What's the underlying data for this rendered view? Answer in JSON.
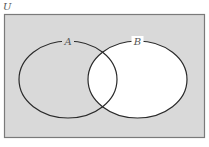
{
  "diagram": {
    "type": "venn",
    "universe": {
      "label": "U",
      "fill": "#d9d9d9",
      "stroke": "#7a7a7a",
      "x": 4,
      "y": 14,
      "width": 201,
      "height": 124
    },
    "sets": [
      {
        "label": "A",
        "cx": 68,
        "cy": 79.5,
        "rx": 49,
        "ry": 38.5,
        "fill": "none",
        "stroke": "#2a2a2a",
        "label_x": 68,
        "label_y": 44
      },
      {
        "label": "B",
        "cx": 137.5,
        "cy": 79.5,
        "rx": 49.5,
        "ry": 38.5,
        "fill": "#ffffff",
        "stroke": "#2a2a2a",
        "label_x": 137.5,
        "label_y": 44
      }
    ],
    "shaded_region": "complement of B (U \\ B)",
    "unshaded_region": "B"
  }
}
